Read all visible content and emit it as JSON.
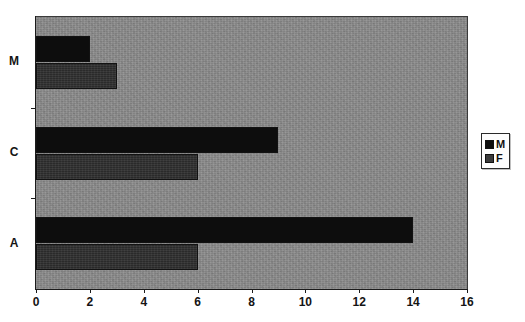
{
  "chart_data": {
    "type": "bar",
    "orientation": "horizontal",
    "title": "",
    "xlabel": "",
    "ylabel": "",
    "categories": [
      "M",
      "C",
      "A"
    ],
    "series": [
      {
        "name": "M",
        "color": "#0d0d0d",
        "values": [
          2,
          9,
          14
        ]
      },
      {
        "name": "F",
        "color": "#3a3a3a",
        "values": [
          3,
          6,
          6
        ]
      }
    ],
    "xlim": [
      0,
      16
    ],
    "xticks": [
      0,
      2,
      4,
      6,
      8,
      10,
      12,
      14,
      16
    ],
    "xtick_labels": [
      "0",
      "2",
      "4",
      "6",
      "8",
      "10",
      "12",
      "14",
      "16"
    ],
    "grid": false,
    "legend_position": "right-outside",
    "legend_entries": [
      "M",
      "F"
    ],
    "plot_background": "#8b8b8b",
    "figure_background": "#ffffff"
  }
}
